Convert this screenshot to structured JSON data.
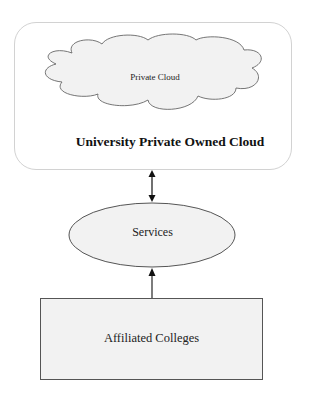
{
  "diagram": {
    "outer_container": {
      "title": "University Private Owned Cloud"
    },
    "cloud": {
      "label": "Private Cloud"
    },
    "services": {
      "label": "Services"
    },
    "colleges": {
      "label": "Affiliated Colleges"
    },
    "connectors": [
      {
        "from": "University Private Owned Cloud",
        "to": "Services",
        "type": "bidirectional-arrow"
      },
      {
        "from": "Affiliated Colleges",
        "to": "Services",
        "type": "arrow"
      }
    ],
    "colors": {
      "outer_border": "#d2d2d2",
      "shape_fill": "#f2f2f2",
      "stroke": "#555555",
      "text": "#1a1a1a"
    }
  }
}
